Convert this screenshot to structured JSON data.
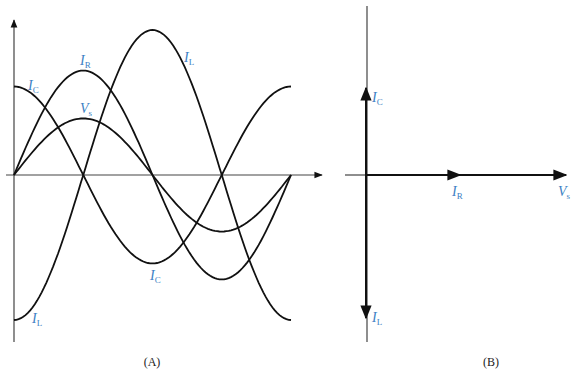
{
  "panels": {
    "a": {
      "caption": "(A)",
      "labels": {
        "ic_top": {
          "main": "I",
          "sub": "C"
        },
        "ir": {
          "main": "I",
          "sub": "R"
        },
        "vs": {
          "main": "V",
          "sub": "s"
        },
        "il_top": {
          "main": "I",
          "sub": "L"
        },
        "ic_bottom": {
          "main": "I",
          "sub": "C"
        },
        "il_bottom": {
          "main": "I",
          "sub": "L"
        }
      }
    },
    "b": {
      "caption": "(B)",
      "labels": {
        "ic": {
          "main": "I",
          "sub": "C"
        },
        "ir": {
          "main": "I",
          "sub": "R"
        },
        "vs": {
          "main": "V",
          "sub": "s"
        },
        "il": {
          "main": "I",
          "sub": "L"
        }
      }
    }
  },
  "colors": {
    "label": "#3d7fc4",
    "curve": "#111111"
  },
  "chart_data": [
    {
      "type": "line",
      "title": "(A) Parallel RLC waveforms",
      "x_unit": "degrees",
      "x": [
        0,
        90,
        180,
        270,
        360
      ],
      "series": [
        {
          "name": "V_s",
          "phase_deg": 0,
          "relative_amplitude": 0.39
        },
        {
          "name": "I_R",
          "phase_deg": 0,
          "relative_amplitude": 0.72
        },
        {
          "name": "I_C",
          "phase_deg": 90,
          "relative_amplitude": 0.61
        },
        {
          "name": "I_L",
          "phase_deg": -90,
          "relative_amplitude": 1.0
        }
      ]
    },
    {
      "type": "phasor",
      "title": "(B) Phasor diagram",
      "phasors": [
        {
          "name": "V_s",
          "angle_deg": 0,
          "relative_length": 1.0
        },
        {
          "name": "I_R",
          "angle_deg": 0,
          "relative_length": 0.45
        },
        {
          "name": "I_C",
          "angle_deg": 90,
          "relative_length": 0.45
        },
        {
          "name": "I_L",
          "angle_deg": -90,
          "relative_length": 0.72
        }
      ]
    }
  ]
}
